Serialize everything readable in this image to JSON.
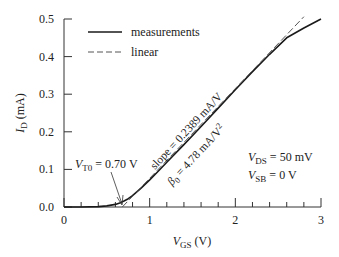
{
  "chart_data": {
    "type": "line",
    "title": "",
    "xlabel": "V_GS (V)",
    "xlabel_parts": {
      "main": "V",
      "sub": "GS",
      "unit": " (V)"
    },
    "ylabel": "I_D (mA)",
    "ylabel_parts": {
      "main": "I",
      "sub": "D",
      "unit": " (mA)"
    },
    "xlim": [
      0,
      3
    ],
    "ylim": [
      0,
      0.5
    ],
    "x_ticks": [
      "0",
      "1",
      "2",
      "3"
    ],
    "x_tick_values": [
      0,
      1,
      2,
      3
    ],
    "x_minor_step": 0.2,
    "y_ticks": [
      "0.0",
      "0.1",
      "0.2",
      "0.3",
      "0.4",
      "0.5"
    ],
    "y_tick_values": [
      0,
      0.1,
      0.2,
      0.3,
      0.4,
      0.5
    ],
    "grid": false,
    "legend_position": "upper left",
    "legend": [
      {
        "label": "measurements",
        "style": "solid"
      },
      {
        "label": "linear",
        "style": "dashed"
      }
    ],
    "series": [
      {
        "name": "measurements",
        "style": "solid",
        "x": [
          0.0,
          0.2,
          0.4,
          0.5,
          0.6,
          0.65,
          0.7,
          0.75,
          0.8,
          0.9,
          1.0,
          1.1,
          1.2,
          1.4,
          1.6,
          1.8,
          2.0,
          2.2,
          2.4,
          2.6,
          2.8,
          3.0
        ],
        "y": [
          0.0,
          0.0,
          0.001,
          0.003,
          0.007,
          0.011,
          0.016,
          0.022,
          0.03,
          0.05,
          0.072,
          0.095,
          0.119,
          0.166,
          0.214,
          0.263,
          0.312,
          0.36,
          0.406,
          0.45,
          0.476,
          0.5
        ]
      },
      {
        "name": "linear",
        "style": "dashed",
        "x": [
          0.68,
          2.8
        ],
        "y": [
          0.0,
          0.506
        ]
      }
    ],
    "annotations": [
      {
        "text": "V_T0 = 0.70 V",
        "main": "V",
        "sub": "T0",
        "rest": " = 0.70 V",
        "arrow_to": [
          0.7,
          0.0
        ]
      },
      {
        "text": "slope = 0.2389 mA/V",
        "rotated": true
      },
      {
        "text": "β0 = 4.78 mA/V2",
        "main": "β",
        "sub": "0",
        "rest": " = 4.78 mA/V",
        "sup": "2",
        "rotated": true
      },
      {
        "text": "V_DS = 50 mV",
        "main": "V",
        "sub": "DS",
        "rest": " = 50 mV"
      },
      {
        "text": "V_SB = 0 V",
        "main": "V",
        "sub": "SB",
        "rest": " = 0 V"
      }
    ]
  },
  "colors": {
    "line": "#1a1a1a",
    "axis": "#333333",
    "text": "#222222",
    "background": "#ffffff"
  }
}
